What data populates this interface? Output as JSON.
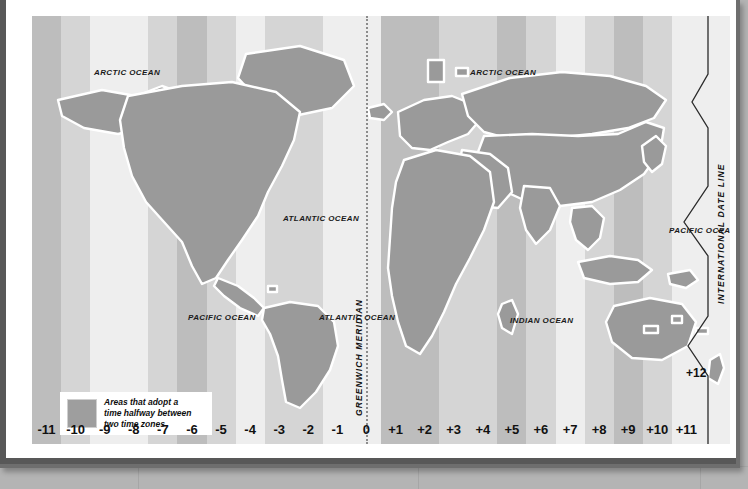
{
  "map": {
    "title": "World Time Zones Map",
    "ocean_labels": [
      {
        "text": "ARCTIC OCEAN",
        "x": 62,
        "y": 52
      },
      {
        "text": "ARCTIC OCEAN",
        "x": 438,
        "y": 52
      },
      {
        "text": "ATLANTIC OCEAN",
        "x": 251,
        "y": 198
      },
      {
        "text": "PACIFIC OCEAN",
        "x": 156,
        "y": 297
      },
      {
        "text": "ATLANTIC OCEAN",
        "x": 287,
        "y": 297
      },
      {
        "text": "INDIAN OCEAN",
        "x": 478,
        "y": 300
      },
      {
        "text": "PACIFIC OCEAN",
        "x": 637,
        "y": 210
      }
    ],
    "meridian_label": "GREENWICH MERIDIAN",
    "date_line_label": "INTERNATIONAL DATE LINE",
    "plus12_label": "+12",
    "zone_labels": [
      "-11",
      "-10",
      "-9",
      "-8",
      "-7",
      "-6",
      "-5",
      "-4",
      "-3",
      "-2",
      "-1",
      "0",
      "+1",
      "+2",
      "+3",
      "+4",
      "+5",
      "+6",
      "+7",
      "+8",
      "+9",
      "+10",
      "+11"
    ],
    "legend": {
      "line1": "Areas that adopt a",
      "line2": "time halfway between",
      "line3": "two time zones",
      "swatch_color": "#9e9e9e"
    },
    "colors": {
      "band_light": "#eeeeee",
      "band_medium": "#d5d5d5",
      "band_dark": "#bdbdbd",
      "land": "#9a9a9a",
      "land_outline": "#ffffff",
      "frame": "#6e6e6e",
      "wall": "#b4b4b4",
      "paper": "#ffffff",
      "text": "#111111",
      "meridian_line": "#8c8c8c"
    }
  },
  "chart_data": {
    "type": "map",
    "zones": [
      {
        "label": "-11",
        "offset": -11,
        "shade": "dark"
      },
      {
        "label": "-10",
        "offset": -10,
        "shade": "medium"
      },
      {
        "label": "-9",
        "offset": -9,
        "shade": "light"
      },
      {
        "label": "-8",
        "offset": -8,
        "shade": "light"
      },
      {
        "label": "-7",
        "offset": -7,
        "shade": "medium"
      },
      {
        "label": "-6",
        "offset": -6,
        "shade": "dark"
      },
      {
        "label": "-5",
        "offset": -5,
        "shade": "medium"
      },
      {
        "label": "-4",
        "offset": -4,
        "shade": "light"
      },
      {
        "label": "-3",
        "offset": -3,
        "shade": "medium"
      },
      {
        "label": "-2",
        "offset": -2,
        "shade": "medium"
      },
      {
        "label": "-1",
        "offset": -1,
        "shade": "light"
      },
      {
        "label": "0",
        "offset": 0,
        "shade": "light"
      },
      {
        "label": "+1",
        "offset": 1,
        "shade": "dark"
      },
      {
        "label": "+2",
        "offset": 2,
        "shade": "dark"
      },
      {
        "label": "+3",
        "offset": 3,
        "shade": "medium"
      },
      {
        "label": "+4",
        "offset": 4,
        "shade": "medium"
      },
      {
        "label": "+5",
        "offset": 5,
        "shade": "dark"
      },
      {
        "label": "+6",
        "offset": 6,
        "shade": "medium"
      },
      {
        "label": "+7",
        "offset": 7,
        "shade": "light"
      },
      {
        "label": "+8",
        "offset": 8,
        "shade": "medium"
      },
      {
        "label": "+9",
        "offset": 9,
        "shade": "dark"
      },
      {
        "label": "+10",
        "offset": 10,
        "shade": "medium"
      },
      {
        "label": "+11",
        "offset": 11,
        "shade": "light"
      },
      {
        "label": "+12",
        "offset": 12,
        "shade": "light"
      }
    ],
    "reference_lines": [
      {
        "name": "GREENWICH MERIDIAN",
        "longitude": 0,
        "style": "dotted"
      },
      {
        "name": "INTERNATIONAL DATE LINE",
        "longitude": 180,
        "style": "zigzag"
      }
    ],
    "oceans": [
      "ARCTIC OCEAN",
      "ATLANTIC OCEAN",
      "PACIFIC OCEAN",
      "INDIAN OCEAN"
    ]
  }
}
